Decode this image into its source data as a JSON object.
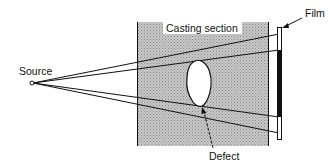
{
  "diagram": {
    "labels": {
      "source": "Source",
      "casting": "Casting section",
      "film": "Film",
      "defect": "Defect"
    },
    "colors": {
      "casting_fill": "#b8b8b8",
      "line": "#111111",
      "film_shadow": "#111111",
      "background": "#ffffff"
    }
  }
}
